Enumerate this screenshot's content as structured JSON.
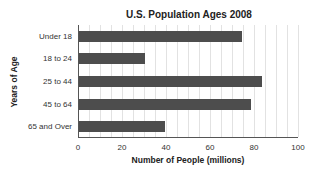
{
  "chart_data": {
    "type": "bar",
    "orientation": "horizontal",
    "title": "U.S. Population Ages 2008",
    "xlabel": "Number of People (millions)",
    "ylabel": "Years of Age",
    "categories": [
      "Under 18",
      "18 to 24",
      "25 to 44",
      "45 to 64",
      "65 and Over"
    ],
    "values": [
      74,
      30,
      83,
      78,
      39
    ],
    "xlim": [
      0,
      100
    ],
    "xticks": [
      0,
      20,
      40,
      60,
      80,
      100
    ],
    "grid": true,
    "legend": "none",
    "bar_color": "#4d4d4d"
  }
}
